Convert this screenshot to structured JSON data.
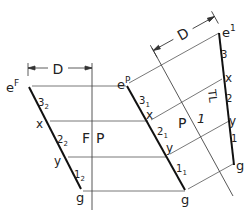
{
  "diagram": {
    "type": "descriptive-geometry-true-length",
    "views": {
      "frontal": {
        "label": "F"
      },
      "profile": {
        "label": "P"
      },
      "auxiliary": {
        "label": "1"
      }
    },
    "fold_lines": [
      {
        "name": "F|P",
        "left": "F",
        "right": "P"
      },
      {
        "name": "P|1",
        "left": "P",
        "right": "1"
      }
    ],
    "dimension": {
      "label": "D"
    },
    "left_line": {
      "top": {
        "base": "e",
        "sup": "F"
      },
      "points": [
        "x",
        "y"
      ],
      "end": "g",
      "segments": [
        {
          "base": "3",
          "sub": "2"
        },
        {
          "base": "2",
          "sub": "2"
        },
        {
          "base": "1",
          "sub": "2"
        }
      ]
    },
    "middle_line": {
      "top": {
        "base": "e",
        "sup": "P"
      },
      "points": [
        "x",
        "y"
      ],
      "end": "g",
      "segments": [
        {
          "base": "3",
          "sub": "1"
        },
        {
          "base": "2",
          "sub": "1"
        },
        {
          "base": "1",
          "sub": "1"
        }
      ]
    },
    "right_line": {
      "top": {
        "base": "e",
        "sup": "1"
      },
      "points": [
        "x",
        "y"
      ],
      "end": "g",
      "segments": [
        "3",
        "2",
        "1"
      ],
      "annotation": "TL"
    }
  }
}
